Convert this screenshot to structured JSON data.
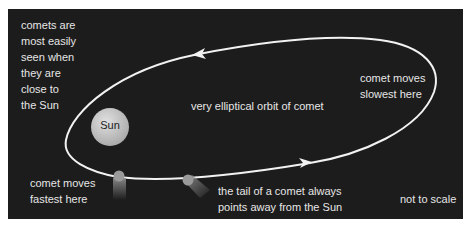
{
  "diagram": {
    "labels": {
      "visibility_note": "comets are\nmost easily\nseen when\nthey are\nclose to\nthe Sun",
      "slowest": "comet moves\nslowest here",
      "orbit": "very elliptical orbit of comet",
      "fastest": "comet moves\nfastest here",
      "tail_note": "the tail of a comet always\npoints away from the Sun",
      "scale_note": "not to scale",
      "sun": "Sun"
    },
    "colors": {
      "background": "#1c1c1c",
      "orbit_line": "#f2f2f2",
      "text": "#e6e6e6",
      "sun_fill": "#c8c8c8",
      "sun_label": "#222222",
      "comet_head": "#9a9a9a"
    },
    "orbit_direction": "counter-clockwise"
  }
}
